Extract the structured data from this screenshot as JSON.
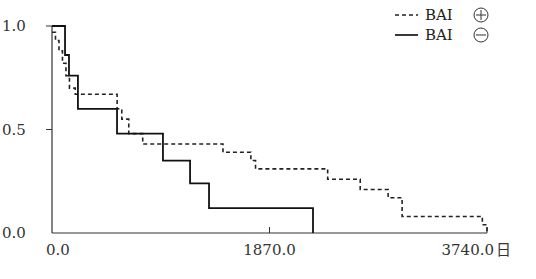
{
  "chart_data": {
    "type": "line",
    "subtype": "kaplan-meier step",
    "title": "",
    "xlabel": "",
    "ylabel": "",
    "x_unit": "日",
    "xlim": [
      0,
      3740
    ],
    "ylim": [
      0,
      1.0
    ],
    "x_ticks": [
      0,
      1870,
      3740
    ],
    "x_tick_labels": [
      "0.0",
      "1870.0",
      "3740.0"
    ],
    "y_ticks": [
      0.0,
      0.5,
      1.0
    ],
    "y_tick_labels": [
      "0.0",
      "0.5",
      "1.0"
    ],
    "grid": false,
    "legend_position": "top-right",
    "series": [
      {
        "name": "BAI ⊕",
        "label": "BAI",
        "symbol": "⊕",
        "style": "dashed",
        "color": "#222222",
        "x": [
          0,
          30,
          60,
          90,
          120,
          150,
          200,
          560,
          600,
          660,
          780,
          1470,
          1710,
          1750,
          2370,
          2650,
          2890,
          3010,
          3700,
          3740
        ],
        "y": [
          0.97,
          0.93,
          0.88,
          0.82,
          0.76,
          0.7,
          0.67,
          0.6,
          0.55,
          0.48,
          0.43,
          0.39,
          0.35,
          0.31,
          0.26,
          0.21,
          0.17,
          0.08,
          0.04,
          0.0
        ]
      },
      {
        "name": "BAI ⊖",
        "label": "BAI",
        "symbol": "⊖",
        "style": "solid",
        "color": "#111111",
        "x": [
          0,
          112,
          146,
          223,
          559,
          954,
          1187,
          1350,
          2244
        ],
        "y": [
          1.0,
          0.86,
          0.76,
          0.6,
          0.48,
          0.35,
          0.24,
          0.12,
          0.0
        ]
      }
    ]
  },
  "legend": {
    "items": [
      {
        "label": "BAI",
        "symbol": "⊕",
        "style": "dashed"
      },
      {
        "label": "BAI",
        "symbol": "⊖",
        "style": "solid"
      }
    ]
  },
  "axes": {
    "x_unit_label": "日"
  }
}
